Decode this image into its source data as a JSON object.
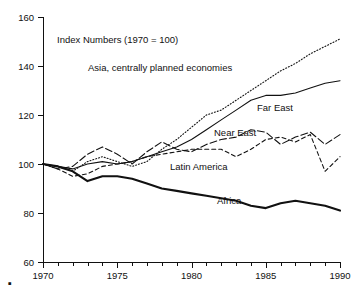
{
  "chart_data": {
    "type": "line",
    "title": "",
    "annotation": "Index Numbers (1970 = 100)",
    "xlabel": "",
    "ylabel": "",
    "xlim": [
      1970,
      1990
    ],
    "ylim": [
      60,
      160
    ],
    "grid": false,
    "legend_position": "inline-labels",
    "y_ticks": [
      60,
      80,
      100,
      120,
      140,
      160
    ],
    "y_tick_labels": [
      "60",
      "80",
      "100",
      "120",
      "140",
      "160"
    ],
    "x_ticks": [
      1970,
      1975,
      1980,
      1985,
      1990
    ],
    "x_tick_labels": [
      "1970",
      "1975",
      "1980",
      "1985",
      "1990"
    ],
    "x_minor_tick_interval": 1,
    "x": [
      1970,
      1971,
      1972,
      1973,
      1974,
      1975,
      1976,
      1977,
      1978,
      1979,
      1980,
      1981,
      1982,
      1983,
      1984,
      1985,
      1986,
      1987,
      1988,
      1989,
      1990
    ],
    "series": [
      {
        "name": "Asia, centrally planned economies",
        "style": "dotted",
        "label": "Asia, centrally planned economies",
        "values": [
          100,
          99,
          97,
          101,
          103,
          101,
          99,
          101,
          106,
          110,
          115,
          120,
          122,
          126,
          130,
          134,
          138,
          141,
          145,
          148,
          151
        ]
      },
      {
        "name": "Far East",
        "style": "solid-thin",
        "label": "Far East",
        "values": [
          100,
          99,
          98,
          100,
          101,
          100,
          101,
          103,
          105,
          107,
          110,
          114,
          118,
          122,
          126,
          128,
          128,
          129,
          131,
          133,
          134
        ]
      },
      {
        "name": "Near East",
        "style": "dash-long",
        "label": "Near East",
        "values": [
          100,
          98,
          99,
          104,
          107,
          104,
          100,
          105,
          109,
          106,
          105,
          108,
          110,
          111,
          114,
          113,
          108,
          111,
          113,
          108,
          112
        ]
      },
      {
        "name": "Latin America",
        "style": "dash-short",
        "label": "Latin America",
        "values": [
          100,
          98,
          95,
          96,
          99,
          100,
          101,
          103,
          104,
          105,
          106,
          106,
          106,
          103,
          106,
          110,
          111,
          109,
          112,
          97,
          103
        ]
      },
      {
        "name": "Africa",
        "style": "solid-thick",
        "label": "Africa",
        "values": [
          100,
          99,
          97,
          93,
          95,
          95,
          94,
          92,
          90,
          89,
          88,
          87,
          86,
          85,
          83,
          82,
          84,
          85,
          84,
          83,
          81
        ]
      }
    ]
  },
  "marks": {
    "corner_dot": "▪"
  }
}
